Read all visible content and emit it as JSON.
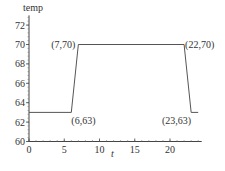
{
  "chart_data": {
    "type": "line",
    "title": "",
    "xlabel": "t",
    "ylabel": "temp",
    "xlim": [
      0,
      24.5
    ],
    "ylim": [
      60,
      73
    ],
    "xticks": [
      0,
      5,
      10,
      15,
      20
    ],
    "yticks": [
      60,
      62,
      64,
      66,
      68,
      70,
      72
    ],
    "grid": false,
    "series": [
      {
        "name": "temp",
        "x": [
          0,
          6,
          7,
          22,
          23,
          24
        ],
        "y": [
          63,
          63,
          70,
          70,
          63,
          63
        ],
        "color": "#555555"
      }
    ],
    "annotations": [
      {
        "text": "(6,63)",
        "x": 6,
        "y": 63,
        "position": "below-right"
      },
      {
        "text": "(7,70)",
        "x": 7,
        "y": 70,
        "position": "left"
      },
      {
        "text": "(22,70)",
        "x": 22,
        "y": 70,
        "position": "right"
      },
      {
        "text": "(23,63)",
        "x": 23,
        "y": 63,
        "position": "below-left"
      }
    ]
  }
}
